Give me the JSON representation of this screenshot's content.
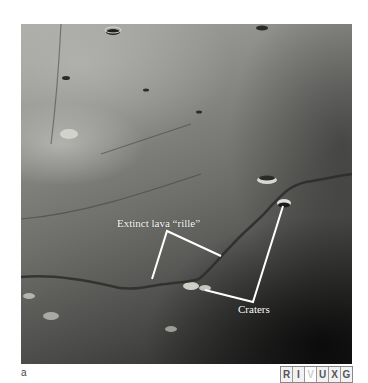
{
  "figure": {
    "panel_letter": "a",
    "photo_description": "Lunar surface with sinuous rille and craters",
    "annotations": {
      "rille_label": "Extinct lava “rille”",
      "craters_label": "Craters"
    },
    "annotation_color": "#ffffff",
    "wavelength_bands": [
      {
        "letter": "R",
        "active": false
      },
      {
        "letter": "I",
        "active": false
      },
      {
        "letter": "V",
        "active": true
      },
      {
        "letter": "U",
        "active": false
      },
      {
        "letter": "X",
        "active": false
      },
      {
        "letter": "G",
        "active": false
      }
    ]
  }
}
